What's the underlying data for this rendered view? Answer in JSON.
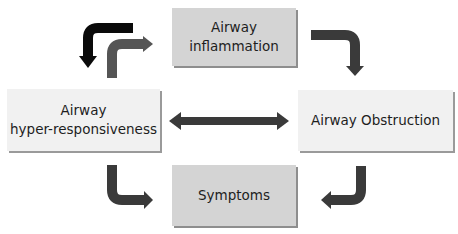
{
  "diagram": {
    "nodes": {
      "inflammation": {
        "line1": "Airway",
        "line2": "inflammation"
      },
      "hyperresponsiveness": {
        "line1": "Airway",
        "line2": "hyper-responsiveness"
      },
      "obstruction": {
        "label": "Airway Obstruction"
      },
      "symptoms": {
        "label": "Symptoms"
      }
    },
    "edges": [
      {
        "from": "hyperresponsiveness",
        "to": "inflammation",
        "style": "gray-elbow"
      },
      {
        "from": "inflammation",
        "to": "hyperresponsiveness",
        "style": "black-elbow"
      },
      {
        "from": "inflammation",
        "to": "obstruction",
        "style": "gray-elbow"
      },
      {
        "from": "hyperresponsiveness",
        "to": "obstruction",
        "style": "double-headed"
      },
      {
        "from": "hyperresponsiveness",
        "to": "symptoms",
        "style": "gray-elbow"
      },
      {
        "from": "obstruction",
        "to": "symptoms",
        "style": "gray-elbow"
      }
    ],
    "colors": {
      "arrow": "#3a3a3a",
      "arrow_black": "#0a0a0a",
      "arrow_gray": "#555555",
      "box_dark": "#d4d4d4",
      "box_light": "#f1f1f1"
    }
  }
}
